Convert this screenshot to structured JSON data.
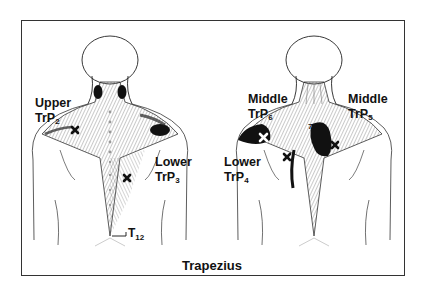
{
  "caption": "Trapezius",
  "figures": [
    {
      "view": "left-back",
      "labels": [
        {
          "line1": "Upper",
          "line2": "TrP",
          "sub": "2"
        },
        {
          "line1": "Lower",
          "line2": "TrP",
          "sub": "3"
        }
      ],
      "vertebra_label": {
        "text": "T",
        "sub": "12"
      }
    },
    {
      "view": "right-back",
      "labels": [
        {
          "line1": "Middle",
          "line2": "TrP",
          "sub": "6"
        },
        {
          "line1": "Middle",
          "line2": "TrP",
          "sub": "5"
        },
        {
          "line1": "Lower",
          "line2": "TrP",
          "sub": "4"
        }
      ],
      "vertebra_label": {
        "text": "7"
      }
    }
  ],
  "colors": {
    "ink": "#111111",
    "shade": "#555555",
    "frame": "#333333",
    "background": "#ffffff"
  }
}
